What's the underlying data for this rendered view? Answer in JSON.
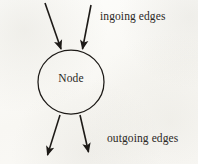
{
  "figure": {
    "kind": "node-edges-diagram",
    "background_color": "#fcfcfa",
    "ink_color": "#1d1a17"
  },
  "node": {
    "label": "Node",
    "shape": "circle",
    "center_x": 71,
    "center_y": 82,
    "radius_x": 33,
    "radius_y": 32
  },
  "labels": {
    "ingoing": "ingoing edges",
    "outgoing": "outgoing edges"
  },
  "edges": {
    "ingoing": [
      {
        "name": "ingoing-edge-left",
        "x1": 45,
        "y1": 3,
        "x2": 61,
        "y2": 50
      },
      {
        "name": "ingoing-edge-right",
        "x1": 91,
        "y1": 5,
        "x2": 82,
        "y2": 50
      }
    ],
    "outgoing": [
      {
        "name": "outgoing-edge-left",
        "x1": 60,
        "y1": 116,
        "x2": 47,
        "y2": 157
      },
      {
        "name": "outgoing-edge-right",
        "x1": 80,
        "y1": 116,
        "x2": 89,
        "y2": 154
      }
    ]
  }
}
